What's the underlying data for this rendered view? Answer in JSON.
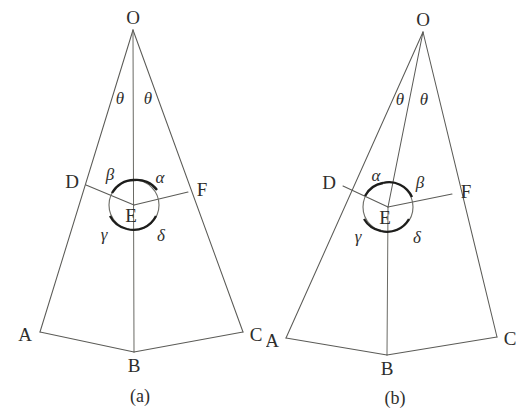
{
  "figure": {
    "background_color": "#ffffff",
    "line_color": "#5b5b57",
    "label_color": "#2e2e2c",
    "arc_mark_color": "#1d1d1b"
  },
  "panels": [
    {
      "id": "a",
      "caption": "(a)",
      "vertices": {
        "O": "O",
        "A": "A",
        "B": "B",
        "C": "C",
        "D": "D",
        "E": "E",
        "F": "F"
      },
      "apex_angles": {
        "left": "θ",
        "right": "θ"
      },
      "center_angles": {
        "upper_left": "β",
        "upper_right": "α",
        "lower_left": "γ",
        "lower_right": "δ"
      },
      "points": {
        "O": [
          133,
          30
        ],
        "A": [
          40,
          332
        ],
        "B": [
          134,
          352
        ],
        "C": [
          243,
          332
        ],
        "D": [
          86,
          185
        ],
        "E": [
          134,
          205
        ],
        "F": [
          188,
          192
        ]
      },
      "segments": [
        [
          "O",
          "A"
        ],
        [
          "O",
          "C"
        ],
        [
          "O",
          "B"
        ],
        [
          "A",
          "B"
        ],
        [
          "B",
          "C"
        ],
        [
          "D",
          "E"
        ],
        [
          "E",
          "F"
        ]
      ],
      "circle_radius": 25
    },
    {
      "id": "b",
      "caption": "(b)",
      "vertices": {
        "O": "O",
        "A": "A",
        "B": "B",
        "C": "C",
        "D": "D",
        "E": "E",
        "F": "F"
      },
      "apex_angles": {
        "left": "θ",
        "right": "θ"
      },
      "center_angles": {
        "upper_left": "α",
        "upper_right": "β",
        "lower_left": "γ",
        "lower_right": "δ"
      },
      "points": {
        "O": [
          423,
          32
        ],
        "A": [
          286,
          338
        ],
        "B": [
          387,
          355
        ],
        "C": [
          497,
          337
        ],
        "D": [
          343,
          186
        ],
        "E": [
          388,
          207
        ],
        "F": [
          452,
          194
        ]
      },
      "segments": [
        [
          "O",
          "A"
        ],
        [
          "O",
          "C"
        ],
        [
          "O",
          "E"
        ],
        [
          "E",
          "B"
        ],
        [
          "A",
          "B"
        ],
        [
          "B",
          "C"
        ],
        [
          "D",
          "E"
        ],
        [
          "E",
          "F"
        ]
      ],
      "circle_radius": 25
    }
  ]
}
